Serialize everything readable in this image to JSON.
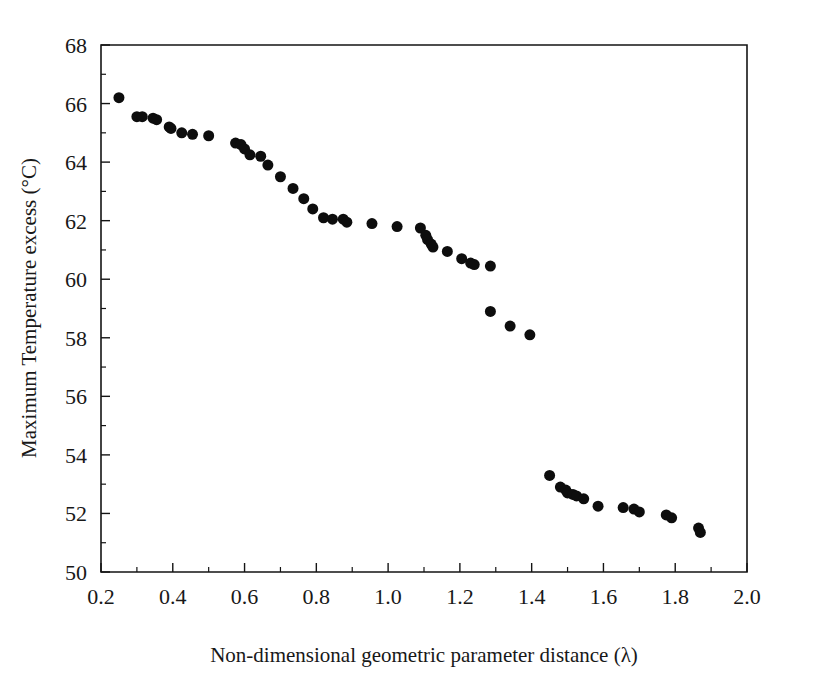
{
  "chart_data": {
    "type": "scatter",
    "title": "",
    "xlabel": "Non-dimensional geometric parameter distance (λ)",
    "ylabel": "Maximum Temperature excess (°C)",
    "xlim": [
      0.2,
      2.0
    ],
    "ylim": [
      50,
      68
    ],
    "x_major_ticks": [
      0.2,
      0.4,
      0.6,
      0.8,
      1.0,
      1.2,
      1.4,
      1.6,
      1.8,
      2.0
    ],
    "x_tick_labels": [
      "0.2",
      "0.4",
      "0.6",
      "0.8",
      "1.0",
      "1.2",
      "1.4",
      "1.6",
      "1.8",
      "2.0"
    ],
    "x_minor_ticks": [
      0.3,
      0.5,
      0.7,
      0.9,
      1.1,
      1.3,
      1.5,
      1.7,
      1.9
    ],
    "y_major_ticks": [
      50,
      52,
      54,
      56,
      58,
      60,
      62,
      64,
      66,
      68
    ],
    "y_tick_labels": [
      "50",
      "52",
      "54",
      "56",
      "58",
      "60",
      "62",
      "64",
      "66",
      "68"
    ],
    "y_minor_ticks": [
      51,
      53,
      55,
      57,
      59,
      61,
      63,
      65,
      67
    ],
    "grid": false,
    "legend": null,
    "marker": "filled-circle",
    "marker_color": "#0d0d0d",
    "marker_size_px": 11,
    "series": [
      {
        "name": "Maximum temperature excess",
        "points": [
          [
            0.25,
            66.2
          ],
          [
            0.3,
            65.55
          ],
          [
            0.315,
            65.55
          ],
          [
            0.345,
            65.5
          ],
          [
            0.355,
            65.45
          ],
          [
            0.39,
            65.2
          ],
          [
            0.395,
            65.15
          ],
          [
            0.425,
            65.0
          ],
          [
            0.455,
            64.95
          ],
          [
            0.5,
            64.9
          ],
          [
            0.575,
            64.65
          ],
          [
            0.59,
            64.6
          ],
          [
            0.6,
            64.45
          ],
          [
            0.615,
            64.25
          ],
          [
            0.645,
            64.2
          ],
          [
            0.665,
            63.9
          ],
          [
            0.7,
            63.5
          ],
          [
            0.735,
            63.1
          ],
          [
            0.765,
            62.75
          ],
          [
            0.79,
            62.4
          ],
          [
            0.82,
            62.1
          ],
          [
            0.845,
            62.05
          ],
          [
            0.875,
            62.05
          ],
          [
            0.885,
            61.95
          ],
          [
            0.955,
            61.9
          ],
          [
            1.025,
            61.8
          ],
          [
            1.09,
            61.75
          ],
          [
            1.105,
            61.5
          ],
          [
            1.11,
            61.35
          ],
          [
            1.12,
            61.2
          ],
          [
            1.125,
            61.1
          ],
          [
            1.165,
            60.95
          ],
          [
            1.205,
            60.7
          ],
          [
            1.23,
            60.55
          ],
          [
            1.24,
            60.5
          ],
          [
            1.285,
            60.45
          ],
          [
            1.285,
            58.9
          ],
          [
            1.34,
            58.4
          ],
          [
            1.395,
            58.1
          ],
          [
            1.45,
            53.3
          ],
          [
            1.48,
            52.9
          ],
          [
            1.495,
            52.8
          ],
          [
            1.5,
            52.7
          ],
          [
            1.515,
            52.65
          ],
          [
            1.525,
            52.6
          ],
          [
            1.545,
            52.5
          ],
          [
            1.585,
            52.25
          ],
          [
            1.655,
            52.2
          ],
          [
            1.685,
            52.15
          ],
          [
            1.7,
            52.05
          ],
          [
            1.775,
            51.95
          ],
          [
            1.79,
            51.85
          ],
          [
            1.865,
            51.5
          ],
          [
            1.87,
            51.35
          ]
        ]
      }
    ]
  },
  "axes": {
    "xlabel": "Non-dimensional geometric parameter distance (λ)",
    "ylabel": "Maximum Temperature excess (°C)"
  }
}
